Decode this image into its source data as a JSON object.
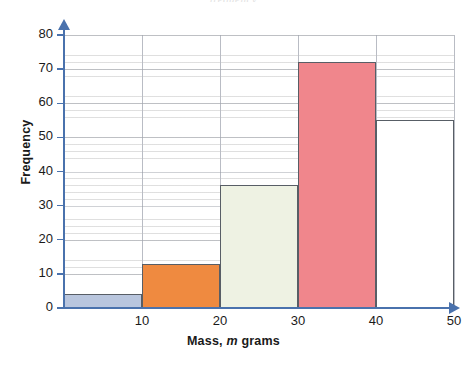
{
  "chart_data": {
    "type": "bar",
    "title": "",
    "xlabel_parts": {
      "pre": "Mass,",
      "italic": "m",
      "post": "grams"
    },
    "xlabel": "Mass, m grams",
    "ylabel": "Frequency",
    "xlim": [
      0,
      50
    ],
    "ylim": [
      0,
      80
    ],
    "grid": true,
    "legend": null,
    "x_tick_labels": [
      "10",
      "20",
      "30",
      "40",
      "50"
    ],
    "x_tick_values": [
      10,
      20,
      30,
      40,
      50
    ],
    "y_tick_labels": [
      "0",
      "10",
      "20",
      "30",
      "40",
      "50",
      "60",
      "70",
      "80"
    ],
    "y_tick_values": [
      0,
      10,
      20,
      30,
      40,
      50,
      60,
      70,
      80
    ],
    "categories": [
      "0-10",
      "10-20",
      "20-30",
      "30-40",
      "40-50"
    ],
    "values": [
      4,
      13,
      36,
      72,
      55
    ],
    "bars": [
      {
        "label": "0-10",
        "x_start": 0,
        "x_end": 10,
        "value": 4,
        "fill": "#b9c6de",
        "edge": "#585e66"
      },
      {
        "label": "10-20",
        "x_start": 10,
        "x_end": 20,
        "value": 13,
        "fill": "#ef8a40",
        "edge": "#585e66"
      },
      {
        "label": "20-30",
        "x_start": 20,
        "x_end": 30,
        "value": 36,
        "fill": "#eef2e3",
        "edge": "#585e66"
      },
      {
        "label": "30-40",
        "x_start": 30,
        "x_end": 40,
        "value": 72,
        "fill": "#f0868c",
        "edge": "#585e66"
      },
      {
        "label": "40-50",
        "x_start": 40,
        "x_end": 50,
        "value": 55,
        "fill": "#ffffff",
        "edge": "#585e66"
      }
    ],
    "axis_color": "#4a72ad",
    "gridline_color": "#b9bcc4",
    "minor_gridline_step": 2
  },
  "title_remnant": "frequency"
}
